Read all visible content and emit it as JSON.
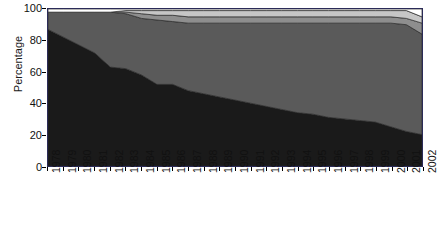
{
  "chart_data": {
    "type": "area",
    "title": "",
    "xlabel": "",
    "ylabel": "Percentage",
    "ylim": [
      0,
      100
    ],
    "yticks": [
      0,
      20,
      40,
      60,
      80,
      100
    ],
    "grid": false,
    "legend": "none",
    "stacked": true,
    "x": [
      1978,
      1979,
      1980,
      1981,
      1982,
      1983,
      1984,
      1985,
      1986,
      1987,
      1988,
      1989,
      1990,
      1991,
      1992,
      1993,
      1994,
      1995,
      1996,
      1997,
      1998,
      1999,
      2000,
      2001,
      2002
    ],
    "categories": [
      "1978",
      "1979",
      "1980",
      "1981",
      "1982",
      "1983",
      "1984",
      "1985",
      "1986",
      "1987",
      "1988",
      "1989",
      "1990",
      "1991",
      "1992",
      "1993",
      "1994",
      "1995",
      "1996",
      "1997",
      "1998",
      "1999",
      "2000",
      "2001",
      "2002"
    ],
    "series": [
      {
        "name": "series-1",
        "color": "#1a1a1a",
        "values": [
          87,
          82,
          77,
          72,
          63,
          62,
          58,
          52,
          52,
          48,
          46,
          44,
          42,
          40,
          38,
          36,
          34,
          33,
          31,
          30,
          29,
          28,
          25,
          22,
          20
        ]
      },
      {
        "name": "series-2",
        "color": "#5a5a5a",
        "values": [
          11,
          16,
          21,
          26,
          35,
          35,
          36,
          41,
          40,
          43,
          45,
          47,
          49,
          51,
          53,
          55,
          57,
          58,
          60,
          61,
          62,
          63,
          66,
          68,
          64
        ]
      },
      {
        "name": "series-3",
        "color": "#8e8e8e",
        "values": [
          0,
          0,
          0,
          0,
          0,
          1,
          3,
          3,
          4,
          4,
          4,
          4,
          4,
          4,
          4,
          4,
          4,
          4,
          4,
          4,
          4,
          4,
          4,
          4,
          7
        ]
      },
      {
        "name": "series-4",
        "color": "#c6c6c6",
        "values": [
          0,
          0,
          0,
          0,
          0,
          1,
          2,
          3,
          3,
          4,
          4,
          4,
          4,
          4,
          4,
          4,
          4,
          4,
          4,
          4,
          4,
          4,
          4,
          5,
          4
        ]
      },
      {
        "name": "series-5",
        "color": "#ffffff",
        "values": [
          2,
          2,
          2,
          2,
          2,
          1,
          1,
          1,
          1,
          1,
          1,
          1,
          1,
          1,
          1,
          1,
          1,
          1,
          1,
          1,
          1,
          1,
          1,
          1,
          5
        ]
      }
    ],
    "plot_border_color": "#2b2b58",
    "band_outline_color": "#2a2a2a"
  }
}
